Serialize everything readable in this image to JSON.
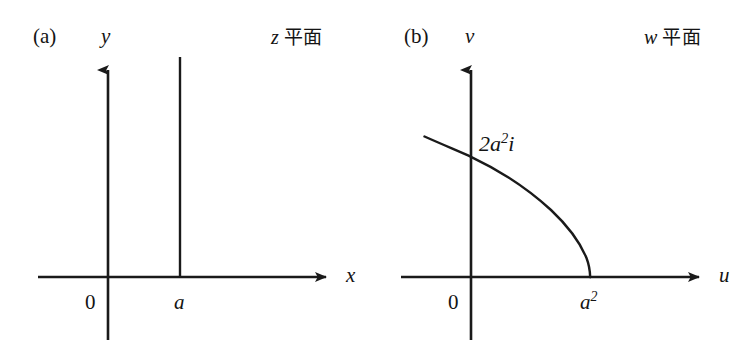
{
  "figure": {
    "background_color": "#ffffff",
    "ink_color": "#1a1a1a",
    "width": 752,
    "height": 350
  },
  "panels": [
    {
      "id": "a",
      "panel_label": "(a)",
      "plane_symbol": "z",
      "plane_word": "平面",
      "axes": {
        "horizontal_label": "x",
        "vertical_label": "y",
        "origin_label": "0"
      },
      "ticks": [
        {
          "axis": "x",
          "label": "a"
        }
      ],
      "curve_kind": "vertical-line",
      "curve_note": "vertical line x = a"
    },
    {
      "id": "b",
      "panel_label": "(b)",
      "plane_symbol": "w",
      "plane_word": "平面",
      "axes": {
        "horizontal_label": "u",
        "vertical_label": "v",
        "origin_label": "0"
      },
      "ticks": [
        {
          "axis": "u",
          "label_base": "a",
          "label_exponent": "2"
        }
      ],
      "annotations": [
        {
          "label_prefix": "2",
          "label_base": "a",
          "label_exponent": "2",
          "label_suffix": "i"
        }
      ],
      "curve_kind": "parabola",
      "curve_note": "image of the line x = a under w = z squared"
    }
  ]
}
